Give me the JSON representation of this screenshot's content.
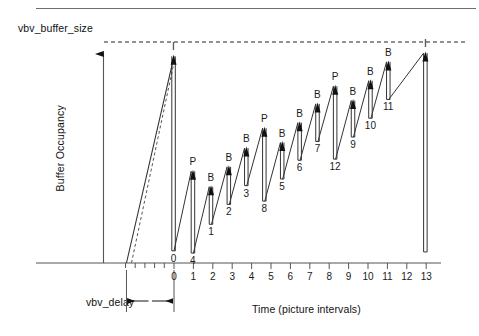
{
  "figure": {
    "caption_rule": true,
    "vbv_buffer_size_label": "vbv_buffer_size",
    "y_axis_title": "Buffer Occupancy",
    "x_axis_title": "Time (picture intervals)",
    "vbv_delay_label": "vbv_delay"
  },
  "chart_data": {
    "type": "line",
    "title": "",
    "subtitle": "",
    "xlabel": "Time (picture intervals)",
    "ylabel": "Buffer Occupancy",
    "xlim": [
      -3,
      13.6
    ],
    "ylim": [
      0,
      1.12
    ],
    "grid": false,
    "legend": "none",
    "annotations": [
      "vbv_buffer_size",
      "vbv_delay"
    ],
    "x_tick_labels": [
      "0",
      "1",
      "2",
      "3",
      "4",
      "5",
      "6",
      "7",
      "8",
      "9",
      "10",
      "11",
      "12",
      "13"
    ],
    "x_tick_values": [
      0,
      1,
      2,
      3,
      4,
      5,
      6,
      7,
      8,
      9,
      10,
      11,
      12,
      13
    ],
    "minor_ticks_left_of_zero": [
      -0.5,
      -1,
      -1.5,
      -2,
      -2.5
    ],
    "y_tick_labels": [],
    "reference_lines": [
      {
        "name": "vbv_buffer_size",
        "y": 1.0,
        "style": "dashed"
      }
    ],
    "fill_ramp": {
      "name": "initial-buffer-fill",
      "x_start": -2.45,
      "x_end": 0.0,
      "y_start": 0.0,
      "y_end": 0.935,
      "second_dashed_ramp": true
    },
    "vbv_delay_span": {
      "x_start": -2.45,
      "x_end": 0.0
    },
    "pictures": [
      {
        "type": "I",
        "number": "0",
        "x": 0.0,
        "peak": 0.935,
        "trough": 0.055
      },
      {
        "type": "P",
        "number": "4",
        "x": 1.0,
        "peak": 0.415,
        "trough": 0.045
      },
      {
        "type": "B",
        "number": "1",
        "x": 1.93,
        "peak": 0.345,
        "trough": 0.175
      },
      {
        "type": "B",
        "number": "2",
        "x": 2.85,
        "peak": 0.435,
        "trough": 0.265
      },
      {
        "type": "B",
        "number": "3",
        "x": 3.75,
        "peak": 0.52,
        "trough": 0.35
      },
      {
        "type": "P",
        "number": "8",
        "x": 4.68,
        "peak": 0.61,
        "trough": 0.28
      },
      {
        "type": "B",
        "number": "5",
        "x": 5.6,
        "peak": 0.545,
        "trough": 0.38
      },
      {
        "type": "B",
        "number": "6",
        "x": 6.5,
        "peak": 0.635,
        "trough": 0.465
      },
      {
        "type": "B",
        "number": "7",
        "x": 7.42,
        "peak": 0.72,
        "trough": 0.55
      },
      {
        "type": "P",
        "number": "12",
        "x": 8.33,
        "peak": 0.8,
        "trough": 0.47
      },
      {
        "type": "B",
        "number": "9",
        "x": 9.25,
        "peak": 0.735,
        "trough": 0.57
      },
      {
        "type": "B",
        "number": "10",
        "x": 10.15,
        "peak": 0.825,
        "trough": 0.655
      },
      {
        "type": "B",
        "number": "11",
        "x": 11.07,
        "peak": 0.91,
        "trough": 0.74
      },
      {
        "type": "I",
        "number": "",
        "x": 12.98,
        "peak": 0.95,
        "trough": 0.05
      }
    ]
  }
}
